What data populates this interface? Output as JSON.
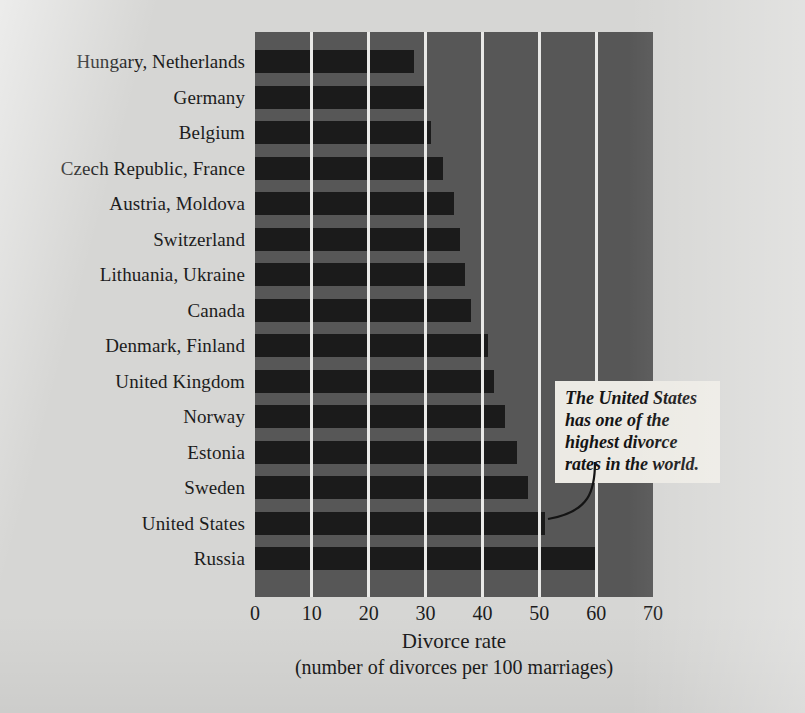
{
  "chart_data": {
    "type": "bar",
    "orientation": "horizontal",
    "title": "",
    "xlabel": "Divorce rate",
    "xlabel_sub": "(number of divorces per 100 marriages)",
    "ylabel": "",
    "xlim": [
      0,
      70
    ],
    "xticks": [
      0,
      10,
      20,
      30,
      40,
      50,
      60,
      70
    ],
    "grid": "vertical",
    "legend": "none",
    "categories": [
      "Hungary, Netherlands",
      "Germany",
      "Belgium",
      "Czech Republic, France",
      "Austria, Moldova",
      "Switzerland",
      "Lithuania, Ukraine",
      "Canada",
      "Denmark, Finland",
      "United Kingdom",
      "Norway",
      "Estonia",
      "Sweden",
      "United States",
      "Russia"
    ],
    "values": [
      28,
      30,
      31,
      33,
      35,
      36,
      37,
      38,
      41,
      42,
      44,
      46,
      48,
      51,
      60
    ],
    "annotations": [
      {
        "text": "The United States has one of the highest divorce rates in the world.",
        "points_to": "United States"
      }
    ]
  },
  "colors": {
    "page_background": "#d6d6d4",
    "plot_background": "#575757",
    "bar": "#1b1b1b",
    "gridline": "#e9e9e7",
    "annotation_background": "#eceae4",
    "text": "#1c1c1c"
  }
}
